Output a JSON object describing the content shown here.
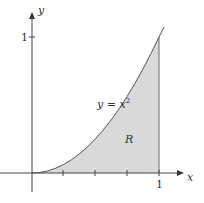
{
  "diagram": {
    "type": "region-under-curve",
    "axes": {
      "x_label": "x",
      "y_label": "y",
      "x_tick_label": "1",
      "y_tick_label": "1"
    },
    "curve_label": "y = x",
    "curve_exponent": "2",
    "region_label": "R",
    "colors": {
      "fill": "#d9d9d9",
      "stroke": "#555555",
      "axis": "#444444"
    }
  }
}
